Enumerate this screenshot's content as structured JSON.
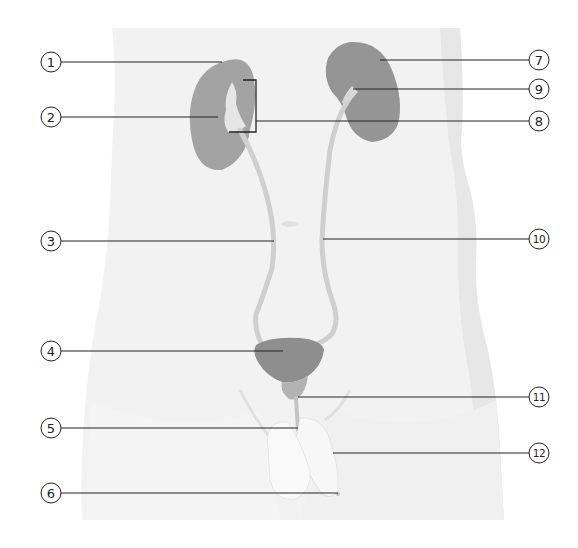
{
  "diagram": {
    "title": "",
    "colors": {
      "background": "#ffffff",
      "body_silhouette": "#f1f1f1",
      "body_shadow": "#e6e6e6",
      "organ_fill": "#9a9a9a",
      "organ_dark": "#8a8a8a",
      "ureter": "#c9c9c9",
      "leader_line": "#222222",
      "circle_stroke": "#222222"
    },
    "callouts": [
      {
        "id": "1",
        "label": "1",
        "side": "left",
        "y": 62,
        "target_x": 222,
        "target_y": 62
      },
      {
        "id": "2",
        "label": "2",
        "side": "left",
        "y": 117,
        "target_x": 218,
        "target_y": 117
      },
      {
        "id": "3",
        "label": "3",
        "side": "left",
        "y": 241,
        "target_x": 274,
        "target_y": 241
      },
      {
        "id": "4",
        "label": "4",
        "side": "left",
        "y": 351,
        "target_x": 283,
        "target_y": 351
      },
      {
        "id": "5",
        "label": "5",
        "side": "left",
        "y": 428,
        "target_x": 298,
        "target_y": 428
      },
      {
        "id": "6",
        "label": "6",
        "side": "left",
        "y": 493,
        "target_x": 338,
        "target_y": 493
      },
      {
        "id": "7",
        "label": "7",
        "side": "right",
        "y": 60,
        "target_x": 380,
        "target_y": 60
      },
      {
        "id": "9",
        "label": "9",
        "side": "right",
        "y": 89,
        "target_x": 353,
        "target_y": 89
      },
      {
        "id": "8",
        "label": "8",
        "side": "right",
        "y": 121,
        "target_x": 256,
        "target_y": 121,
        "bracket": {
          "x": 256,
          "top": 80,
          "bottom": 132,
          "tip_top_x": 243,
          "tip_bottom_x": 229
        }
      },
      {
        "id": "10",
        "label": "10",
        "side": "right",
        "y": 239,
        "target_x": 323,
        "target_y": 239
      },
      {
        "id": "11",
        "label": "11",
        "side": "right",
        "y": 397,
        "target_x": 298,
        "target_y": 397
      },
      {
        "id": "12",
        "label": "12",
        "side": "right",
        "y": 453,
        "target_x": 333,
        "target_y": 453
      }
    ]
  }
}
